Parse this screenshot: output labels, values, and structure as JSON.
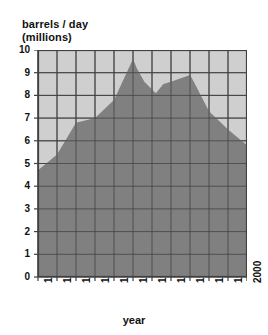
{
  "chart_data": {
    "type": "area",
    "title": "",
    "ylabel_line1": "barrels / day",
    "ylabel_line2": "(millions)",
    "xlabel": "year",
    "xlim": [
      1945,
      2000
    ],
    "ylim": [
      0,
      10
    ],
    "grid": true,
    "legend": "none",
    "y_ticks": [
      10,
      9,
      8,
      7,
      6,
      5,
      4,
      3,
      2,
      1,
      0
    ],
    "x_ticks": [
      1945,
      1950,
      1955,
      1960,
      1965,
      1970,
      1975,
      1980,
      1985,
      1990,
      1995,
      2000
    ],
    "x": [
      1945,
      1950,
      1955,
      1960,
      1965,
      1970,
      1971,
      1973,
      1976,
      1978,
      1980,
      1985,
      1986,
      1990,
      1995,
      2000
    ],
    "values": [
      4.7,
      5.4,
      6.8,
      7.0,
      7.8,
      9.6,
      9.2,
      8.6,
      8.1,
      8.5,
      8.6,
      8.9,
      8.6,
      7.3,
      6.5,
      5.8
    ],
    "series": [
      {
        "name": "barrels / day (millions)",
        "values": [
          4.7,
          5.4,
          6.8,
          7.0,
          7.8,
          9.6,
          9.2,
          8.6,
          8.1,
          8.5,
          8.6,
          8.9,
          8.6,
          7.3,
          6.5,
          5.8
        ]
      }
    ],
    "colors": {
      "area_fill": "#808080",
      "plot_background": "#cfcfcf",
      "grid_line": "#404040",
      "axis_line": "#404040",
      "text": "#111111",
      "page_background": "#ffffff"
    }
  }
}
